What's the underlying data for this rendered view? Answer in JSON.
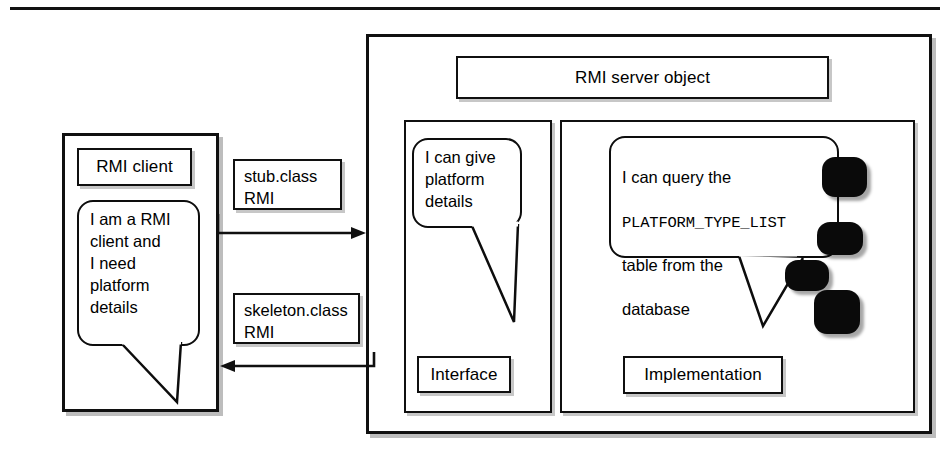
{
  "diagram": {
    "background": "#ffffff",
    "line_color": "#101010"
  },
  "top_rule": {
    "name": "horizontal-rule"
  },
  "client": {
    "label": "RMI client",
    "bubble": "I am a RMI\nclient and\nI need\nplatform\ndetails"
  },
  "channels": {
    "stub": "stub.class\nRMI",
    "skeleton": "skeleton.class\nRMI",
    "stub_direction": "right",
    "skeleton_direction": "left"
  },
  "server": {
    "label": "RMI server object",
    "interface": {
      "label": "Interface",
      "bubble": "I can give\nplatform\ndetails"
    },
    "implementation": {
      "label": "Implementation",
      "bubble_line1": "I can query the",
      "bubble_mono": "PLATFORM_TYPE_LIST",
      "bubble_line3": "table from the",
      "bubble_line4": "database"
    }
  },
  "database": {
    "name": "database-stack",
    "blob_count": 4,
    "color": "#0a0a0a"
  }
}
